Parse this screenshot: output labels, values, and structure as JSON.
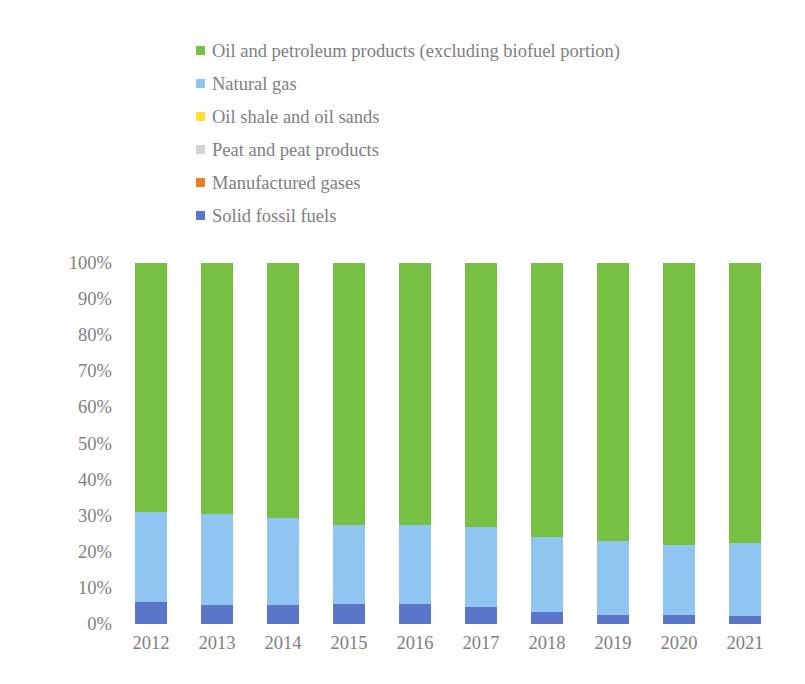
{
  "chart_data": {
    "type": "bar",
    "stacked": true,
    "stacked_mode": "percent",
    "title": "",
    "subtitle": "",
    "xlabel": "",
    "ylabel": "",
    "ylim": [
      0,
      100
    ],
    "grid": false,
    "legend_position": "top-left",
    "categories": [
      "2012",
      "2013",
      "2014",
      "2015",
      "2016",
      "2017",
      "2018",
      "2019",
      "2020",
      "2021"
    ],
    "y_ticks": [
      "0%",
      "10%",
      "20%",
      "30%",
      "40%",
      "50%",
      "60%",
      "70%",
      "80%",
      "90%",
      "100%"
    ],
    "y_tick_values": [
      0,
      10,
      20,
      30,
      40,
      50,
      60,
      70,
      80,
      90,
      100
    ],
    "series": [
      {
        "name": "Oil and petroleum products (excluding biofuel portion)",
        "color": "#76c043",
        "values": [
          69.0,
          69.5,
          70.5,
          72.5,
          72.5,
          73.0,
          76.0,
          77.0,
          78.0,
          77.5
        ]
      },
      {
        "name": "Natural gas",
        "color": "#8fc5f0",
        "values": [
          24.9,
          25.2,
          24.3,
          22.0,
          22.0,
          22.2,
          20.6,
          20.4,
          19.4,
          20.3
        ]
      },
      {
        "name": "Oil shale and oil sands",
        "color": "#ffe033",
        "values": [
          0.0,
          0.0,
          0.0,
          0.0,
          0.0,
          0.0,
          0.0,
          0.0,
          0.0,
          0.0
        ]
      },
      {
        "name": "Peat and peat products",
        "color": "#cfd6cf",
        "values": [
          0.0,
          0.0,
          0.0,
          0.0,
          0.0,
          0.0,
          0.0,
          0.0,
          0.0,
          0.0
        ]
      },
      {
        "name": "Manufactured gases",
        "color": "#f07d28",
        "values": [
          0.0,
          0.0,
          0.0,
          0.0,
          0.0,
          0.0,
          0.0,
          0.0,
          0.0,
          0.0
        ]
      },
      {
        "name": "Solid fossil fuels",
        "color": "#5b76c9",
        "values": [
          6.1,
          5.3,
          5.2,
          5.5,
          5.5,
          4.8,
          3.4,
          2.6,
          2.6,
          2.2
        ]
      }
    ]
  },
  "legend": {
    "items": [
      {
        "label": "Oil and petroleum products (excluding biofuel portion)",
        "color": "#76c043",
        "swatch_name": "legend-swatch-oil-petroleum"
      },
      {
        "label": "Natural gas",
        "color": "#8fc5f0",
        "swatch_name": "legend-swatch-natural-gas"
      },
      {
        "label": "Oil shale and oil sands",
        "color": "#ffe033",
        "swatch_name": "legend-swatch-oil-shale"
      },
      {
        "label": "Peat and peat products",
        "color": "#cfd6cf",
        "swatch_name": "legend-swatch-peat"
      },
      {
        "label": "Manufactured gases",
        "color": "#f07d28",
        "swatch_name": "legend-swatch-manufactured-gases"
      },
      {
        "label": "Solid fossil fuels",
        "color": "#5b76c9",
        "swatch_name": "legend-swatch-solid-fossil-fuels"
      }
    ]
  },
  "colors": {
    "background": "#ffffff",
    "text": "#808080",
    "oil_petroleum": "#76c043",
    "natural_gas": "#8fc5f0",
    "oil_shale": "#ffe033",
    "peat": "#cfd6cf",
    "manufactured_gases": "#f07d28",
    "solid_fossil_fuels": "#5b76c9"
  }
}
